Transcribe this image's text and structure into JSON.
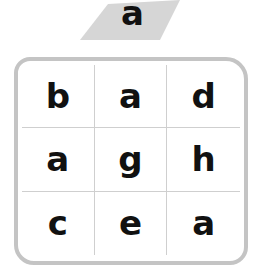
{
  "target": {
    "letter": "a"
  },
  "grid": {
    "cells": [
      "b",
      "a",
      "d",
      "a",
      "g",
      "h",
      "c",
      "e",
      "a"
    ]
  },
  "colors": {
    "frame": "#c4c4c4",
    "highlight": "#d9d9d9",
    "text": "#111111"
  }
}
